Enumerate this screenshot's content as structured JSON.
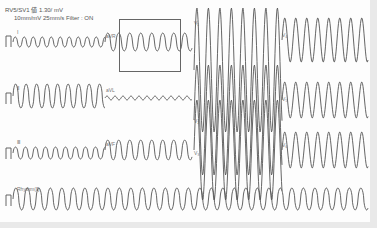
{
  "header": {
    "line1": "RV5/SV1 値  1.30/   mV",
    "line2": "10mm/mV   25mm/s   Filter : ON"
  },
  "leads": {
    "I": "Ⅰ",
    "II": "Ⅱ",
    "III": "Ⅲ",
    "aVR": "aVR",
    "aVL": "aVL",
    "aVF": "aVF",
    "V1": "V₁",
    "V2": "V₂",
    "V3": "V₃",
    "V4": "V₄",
    "V5": "V₅",
    "V6": "V₆",
    "rhythm": "Rhythm(Ⅱ)"
  },
  "selection_box": {
    "x": 119,
    "y": 19,
    "width": 62,
    "height": 53
  },
  "colors": {
    "trace": "#555555",
    "background": "#fdfdfd",
    "border": "#e9e9e9"
  }
}
